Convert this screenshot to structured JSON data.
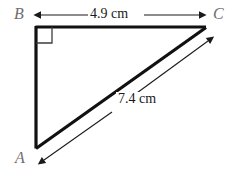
{
  "figure": {
    "type": "right-triangle-diagram",
    "background_color": "#ffffff",
    "stroke_color": "#111111",
    "label_color": "#6e6e6e",
    "vertices": {
      "A": {
        "label": "A",
        "x": 36,
        "y": 148
      },
      "B": {
        "label": "B",
        "x": 36,
        "y": 27
      },
      "C": {
        "label": "C",
        "x": 205,
        "y": 27
      }
    },
    "right_angle": {
      "at_vertex": "B",
      "marker": "square"
    },
    "sides": [
      {
        "name": "AB",
        "from": "A",
        "to": "B",
        "measure_label": null
      },
      {
        "name": "BC",
        "from": "B",
        "to": "C",
        "measure_label": "4.9 cm"
      },
      {
        "name": "AC",
        "from": "A",
        "to": "C",
        "measure_label": "7.4 cm"
      }
    ],
    "dimensions": [
      {
        "id": "dim-bc",
        "text": "4.9 cm",
        "orientation": "horizontal",
        "arrowheads": "both",
        "measures_side": "BC"
      },
      {
        "id": "dim-ac",
        "text": "7.4 cm",
        "orientation": "diagonal",
        "arrowheads": "both",
        "measures_side": "AC"
      }
    ]
  }
}
